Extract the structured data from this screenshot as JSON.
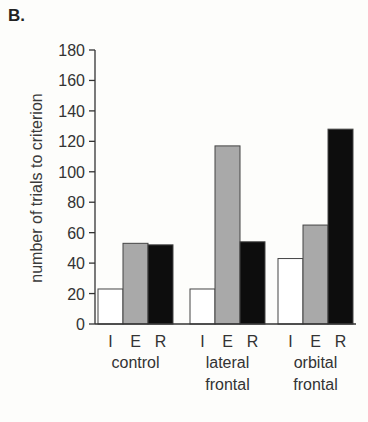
{
  "panel_label": "B.",
  "chart_data": {
    "type": "bar",
    "title": "",
    "panel": "B.",
    "xlabel": "",
    "ylabel": "number of trials to criterion",
    "ylim": [
      0,
      180
    ],
    "yticks": [
      0,
      20,
      40,
      60,
      80,
      100,
      120,
      140,
      160,
      180
    ],
    "grid": false,
    "legend": null,
    "groups": [
      {
        "label_lines": [
          "control"
        ],
        "label": "control"
      },
      {
        "label_lines": [
          "lateral",
          "frontal"
        ],
        "label": "lateral frontal"
      },
      {
        "label_lines": [
          "orbital",
          "frontal"
        ],
        "label": "orbital frontal"
      }
    ],
    "subcategories": [
      "I",
      "E",
      "R"
    ],
    "series": [
      {
        "name": "I",
        "color": "#ffffff",
        "values": [
          23,
          23,
          43
        ]
      },
      {
        "name": "E",
        "color": "#a9a9a9",
        "values": [
          53,
          117,
          65
        ]
      },
      {
        "name": "R",
        "color": "#0d0d0d",
        "values": [
          52,
          54,
          128
        ]
      }
    ]
  }
}
